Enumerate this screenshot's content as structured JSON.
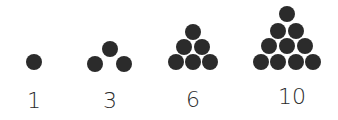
{
  "dot_color": "#2b2b2b",
  "groups": [
    {
      "label": "1",
      "label_x": 34,
      "dots": [
        [
          34,
          62
        ]
      ]
    },
    {
      "label": "3",
      "label_x": 110,
      "dots": [
        [
          110,
          49
        ],
        [
          95,
          64
        ],
        [
          124,
          64
        ]
      ]
    },
    {
      "label": "6",
      "label_x": 193,
      "dots": [
        [
          193,
          32
        ],
        [
          184,
          47
        ],
        [
          202,
          47
        ],
        [
          176,
          62
        ],
        [
          193,
          62
        ],
        [
          210,
          62
        ]
      ]
    },
    {
      "label": "10",
      "label_x": 290,
      "dots": [
        [
          287,
          14
        ],
        [
          278,
          31
        ],
        [
          296,
          31
        ],
        [
          269,
          46
        ],
        [
          287,
          46
        ],
        [
          305,
          46
        ],
        [
          261,
          62
        ],
        [
          278,
          62
        ],
        [
          296,
          62
        ],
        [
          313,
          62
        ]
      ]
    }
  ]
}
